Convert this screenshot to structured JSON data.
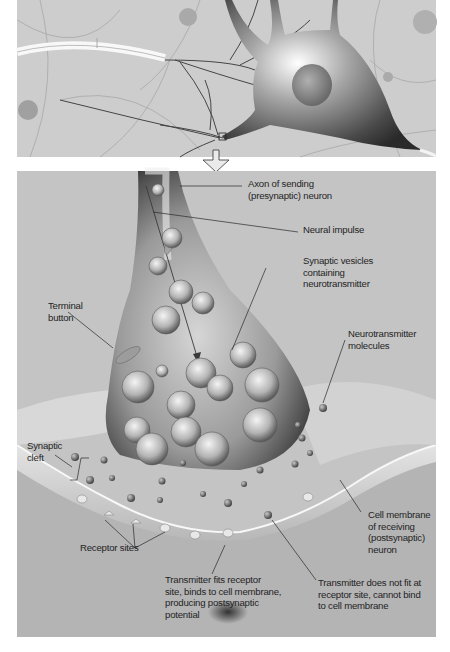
{
  "figure": {
    "top_panel": {
      "description": "Neuron with dendrites and axon terminals; magnified region marked by small square",
      "zoom_marker": "square-marker",
      "arrow": "down-arrow"
    },
    "bottom_panel": {
      "description": "Synapse close-up"
    },
    "labels": {
      "axon": "Axon of sending\n(presynaptic) neuron",
      "impulse": "Neural impulse",
      "vesicles": "Synaptic vesicles\ncontaining\nneurotransmitter",
      "terminal": "Terminal\nbutton",
      "molecules": "Neurotransmitter\nmolecules",
      "cleft": "Synaptic\ncleft",
      "membrane": "Cell membrane\nof receiving\n(postsynaptic)\nneuron",
      "receptors": "Receptor sites",
      "fits": "Transmitter fits receptor\nsite, binds to cell membrane,\nproducing postsynaptic\npotential",
      "nofit": "Transmitter does not fit at\nreceptor site, cannot bind\nto cell membrane"
    },
    "colors": {
      "panel_bg": "#c4c4c4",
      "neuron_dark": "#3a3a3a",
      "neuron_light": "#e8e8e8",
      "label_text": "#1f1f1f",
      "leader_line": "#2a2a2a"
    }
  }
}
